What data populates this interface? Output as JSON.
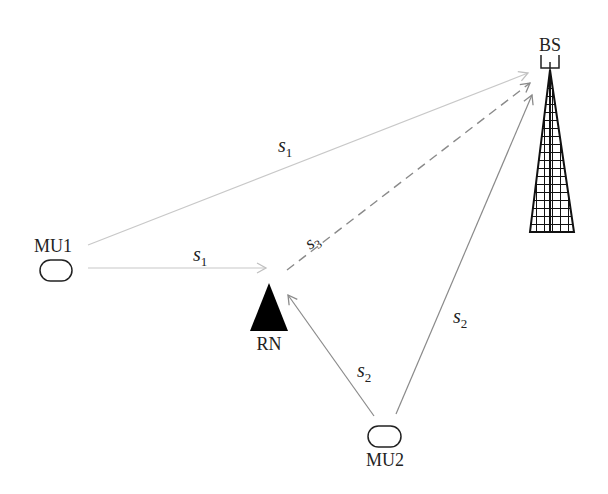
{
  "diagram": {
    "nodes": {
      "bs": {
        "label": "BS"
      },
      "mu1": {
        "label": "MU1"
      },
      "rn": {
        "label": "RN"
      },
      "mu2": {
        "label": "MU2"
      }
    },
    "edges": [
      {
        "from": "MU1",
        "to": "BS",
        "symbol": "s",
        "sub": "1",
        "style": "solid-light"
      },
      {
        "from": "MU1",
        "to": "RN",
        "symbol": "s",
        "sub": "1",
        "style": "solid-light"
      },
      {
        "from": "RN",
        "to": "BS",
        "symbol": "s",
        "sub": "3",
        "style": "dashed"
      },
      {
        "from": "MU2",
        "to": "RN",
        "symbol": "s",
        "sub": "2",
        "style": "solid"
      },
      {
        "from": "MU2",
        "to": "BS",
        "symbol": "s",
        "sub": "2",
        "style": "solid"
      }
    ],
    "colors": {
      "light_line": "#c8c8c8",
      "line": "#8a8a8a",
      "dashed": "#8a8a8a",
      "ink": "#111111"
    }
  }
}
